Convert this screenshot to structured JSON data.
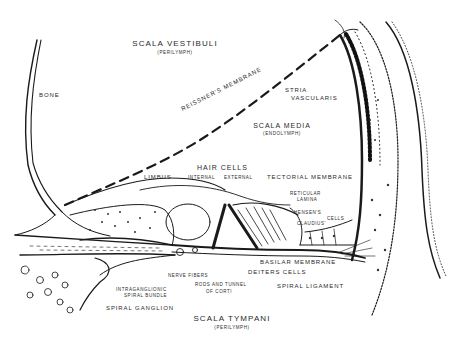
{
  "figure": {
    "regions": {
      "scala_vestibuli": {
        "label": "SCALA VESTIBULI",
        "fluid": "(PERILYMPH)"
      },
      "scala_media": {
        "label": "SCALA MEDIA",
        "fluid": "(ENDOLYMPH)"
      },
      "scala_tympani": {
        "label": "SCALA TYMPANI",
        "fluid": "(PERILYMPH)"
      }
    },
    "labels": {
      "bone": "BONE",
      "reissners_membrane": "REISSNER'S MEMBRANE",
      "stria_vascularis_line1": "STRIA",
      "stria_vascularis_line2": "VASCULARIS",
      "limbus": "LIMBUS",
      "hair_cells": "HAIR CELLS",
      "hair_cells_internal": "INTERNAL",
      "hair_cells_external": "EXTERNAL",
      "tectorial_membrane": "TECTORIAL MEMBRANE",
      "reticular_lamina_line1": "RETICULAR",
      "reticular_lamina_line2": "LAMINA",
      "hensens": "HENSEN'S",
      "cells": "CELLS",
      "claudius": "CLAUDIUS'",
      "basilar_membrane": "BASILAR MEMBRANE",
      "deiters_cells": "DEITERS CELLS",
      "nerve_fibers": "NERVE FIBERS",
      "rods_tunnel_line1": "RODS AND TUNNEL",
      "rods_tunnel_line2": "OF CORTI",
      "spiral_ligament": "SPIRAL LIGAMENT",
      "intraganglionic_line1": "INTRAGANGLIONIC",
      "intraganglionic_line2": "SPIRAL BUNDLE",
      "spiral_ganglion": "SPIRAL GANGLION"
    },
    "colors": {
      "ink": "#1a1a1a",
      "stipple": "#333333",
      "background": "#ffffff"
    }
  }
}
